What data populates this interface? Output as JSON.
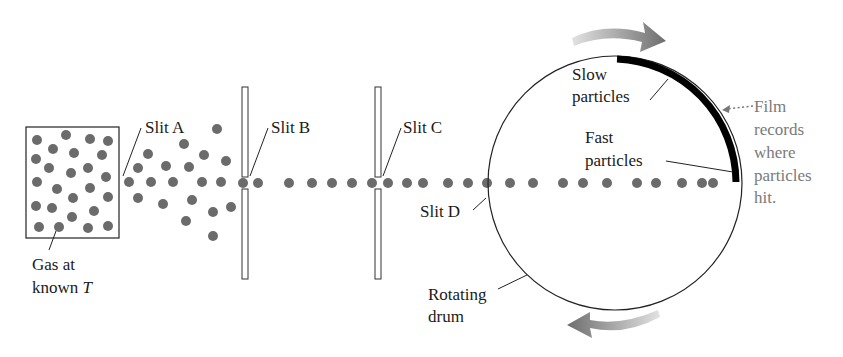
{
  "colors": {
    "particle": "#6b6b6b",
    "outline": "#222222",
    "film": "#000000",
    "film_label": "#7a7a7a",
    "arrow_dark": "#6e6e6e",
    "arrow_light": "#dcdcdc"
  },
  "labels": {
    "slit_a": "Slit A",
    "slit_b": "Slit B",
    "slit_c": "Slit C",
    "slit_d": "Slit D",
    "gas_line1": "Gas at",
    "gas_line2": "known ",
    "gas_var": "T",
    "slow_line1": "Slow",
    "slow_line2": "particles",
    "fast_line1": "Fast",
    "fast_line2": "particles",
    "film_line1": "Film",
    "film_line2": "records",
    "film_line3": "where",
    "film_line4": "particles",
    "film_line5": "hit.",
    "drum_line1": "Rotating",
    "drum_line2": "drum"
  },
  "gas_box": {
    "x": 26,
    "y": 127,
    "width": 93,
    "height": 111
  },
  "gas_particles": [
    [
      37,
      140
    ],
    [
      66,
      135
    ],
    [
      90,
      139
    ],
    [
      108,
      141
    ],
    [
      53,
      149
    ],
    [
      74,
      153
    ],
    [
      102,
      155
    ],
    [
      36,
      159
    ],
    [
      49,
      168
    ],
    [
      88,
      168
    ],
    [
      71,
      173
    ],
    [
      106,
      177
    ],
    [
      37,
      182
    ],
    [
      57,
      189
    ],
    [
      90,
      188
    ],
    [
      73,
      198
    ],
    [
      108,
      197
    ],
    [
      36,
      206
    ],
    [
      52,
      208
    ],
    [
      94,
      211
    ],
    [
      72,
      217
    ],
    [
      39,
      227
    ],
    [
      59,
      227
    ],
    [
      88,
      228
    ],
    [
      108,
      226
    ]
  ],
  "fan_particles": [
    [
      129,
      182
    ],
    [
      138,
      168
    ],
    [
      148,
      154
    ],
    [
      151,
      182
    ],
    [
      138,
      198
    ],
    [
      166,
      166
    ],
    [
      173,
      182
    ],
    [
      163,
      204
    ],
    [
      184,
      144
    ],
    [
      189,
      167
    ],
    [
      202,
      182
    ],
    [
      192,
      200
    ],
    [
      186,
      221
    ],
    [
      217,
      129
    ],
    [
      204,
      155
    ],
    [
      226,
      161
    ],
    [
      221,
      182
    ],
    [
      231,
      207
    ],
    [
      213,
      212
    ],
    [
      213,
      236
    ]
  ],
  "beam_particles_x": [
    243,
    258,
    289,
    312,
    332,
    352,
    372,
    388,
    407,
    423,
    448,
    468,
    487,
    510,
    533,
    563,
    583,
    607,
    637,
    656,
    682,
    702,
    713
  ],
  "beam_y": 183,
  "barriers": [
    {
      "name": "slit-b",
      "x": 242,
      "width": 6,
      "top": 87,
      "bottom": 279
    },
    {
      "name": "slit-c",
      "x": 375,
      "width": 6,
      "top": 87,
      "bottom": 279
    }
  ],
  "drum": {
    "cx": 615,
    "cy": 183,
    "r": 127
  }
}
